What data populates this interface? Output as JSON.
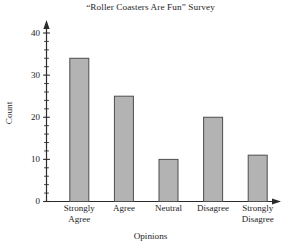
{
  "chart_data": {
    "type": "bar",
    "title": "“Roller Coasters Are Fun” Survey",
    "xlabel": "Opinions",
    "ylabel": "Count",
    "categories": [
      "Strongly Agree",
      "Agree",
      "Neutral",
      "Disagree",
      "Strongly Disagree"
    ],
    "category_lines": [
      [
        "Strongly",
        "Agree"
      ],
      [
        "Agree",
        ""
      ],
      [
        "Neutral",
        ""
      ],
      [
        "Disagree",
        ""
      ],
      [
        "Strongly",
        "Disagree"
      ]
    ],
    "values": [
      34,
      25,
      10,
      20,
      11
    ],
    "ylim": [
      0,
      40
    ],
    "y_major_ticks": [
      0,
      10,
      20,
      30,
      40
    ],
    "y_major_tick_labels": [
      "0",
      "10",
      "20",
      "30",
      "40"
    ],
    "y_minor_tick_step": 2,
    "grid": false,
    "legend": false,
    "bar_fill": "#b3b3b3",
    "bar_stroke": "#4d4d4d",
    "axis_color": "#2b2b2b",
    "background": "#ffffff",
    "axis_arrows": true
  }
}
